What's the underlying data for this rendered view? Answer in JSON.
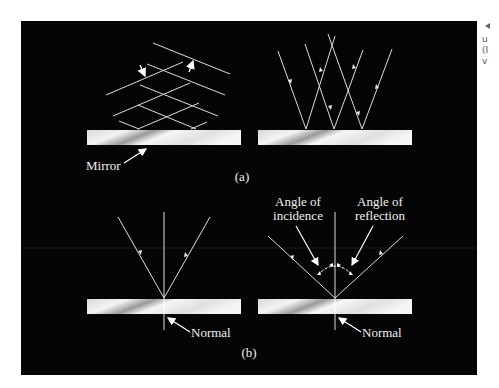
{
  "figure": {
    "panel_a": {
      "label": "(a)",
      "mirror_label": "Mirror"
    },
    "panel_b": {
      "label": "(b)",
      "left_normal_label": "Normal",
      "right_normal_label": "Normal",
      "angle_of_incidence": [
        "Angle of",
        "incidence"
      ],
      "angle_of_reflection": [
        "Angle of",
        "reflection"
      ]
    },
    "side_caption_fragments": [
      "u",
      "(I",
      "v"
    ],
    "colors": {
      "background": "#050505",
      "ray": "#e6e6e6",
      "mirror_light": "#f2f2f2",
      "mirror_dark": "#8a8a8a"
    }
  }
}
